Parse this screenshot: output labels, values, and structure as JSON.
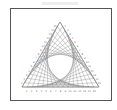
{
  "figure": {
    "caption": "",
    "type": "curve-stitching string art",
    "shape": "equilateral triangle",
    "divisions_per_side": 15,
    "vertices": {
      "apex": [
        60,
        22
      ],
      "bottom_left": [
        22,
        87
      ],
      "bottom_right": [
        99,
        87
      ]
    },
    "edge_labels": {
      "bottom": [
        "1",
        "2",
        "3",
        "4",
        "5",
        "6",
        "7",
        "8",
        "9",
        "10",
        "11",
        "12",
        "13",
        "14",
        "15"
      ],
      "left": [
        "1",
        "2",
        "3",
        "4",
        "5",
        "6",
        "7",
        "8",
        "9",
        "10",
        "11",
        "12",
        "13",
        "14",
        "15"
      ],
      "right": [
        "1",
        "2",
        "3",
        "4",
        "5",
        "6",
        "7",
        "8",
        "9",
        "10",
        "11",
        "12",
        "13",
        "14",
        "15"
      ]
    },
    "colors": {
      "frame": "#555555",
      "thread": "#7a7a7a",
      "edge": "#8a8a8a",
      "label": "#666666"
    }
  }
}
